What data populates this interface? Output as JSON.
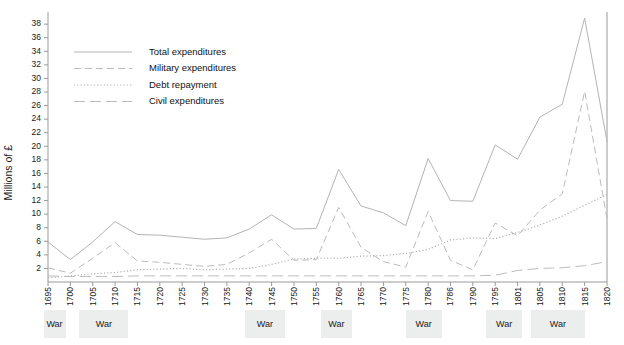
{
  "chart_data": {
    "type": "line",
    "title": "",
    "xlabel": "",
    "ylabel": "Millions of £",
    "ylim": [
      0,
      39
    ],
    "yticks": [
      2,
      4,
      6,
      8,
      10,
      12,
      14,
      16,
      18,
      20,
      22,
      24,
      26,
      28,
      30,
      32,
      34,
      36,
      38
    ],
    "grid": false,
    "legend_position": "top-left",
    "x": [
      1695,
      1700,
      1705,
      1710,
      1715,
      1720,
      1725,
      1730,
      1735,
      1740,
      1745,
      1750,
      1755,
      1760,
      1765,
      1770,
      1775,
      1780,
      1786,
      1790,
      1795,
      1801,
      1805,
      1810,
      1815,
      1820
    ],
    "xtick_labels": [
      "1695",
      "1700",
      "1705",
      "1710",
      "1715",
      "1720",
      "1725",
      "1730",
      "1735",
      "1740",
      "1745",
      "1750",
      "1755",
      "1760",
      "1765",
      "1770",
      "1775",
      "1780",
      "1786",
      "1790",
      "1795",
      "1801",
      "1805",
      "1810",
      "1815",
      "1820"
    ],
    "series": [
      {
        "name": "Total expenditures",
        "style": "solid",
        "values": [
          5.9,
          3.3,
          5.9,
          8.9,
          7.0,
          6.9,
          6.6,
          6.3,
          6.5,
          7.8,
          9.9,
          7.8,
          7.9,
          16.6,
          11.2,
          10.2,
          8.3,
          18.2,
          12.0,
          11.9,
          20.2,
          18.1,
          24.3,
          26.2,
          38.9,
          20.7
        ]
      },
      {
        "name": "Military expenditures",
        "style": "short-dash",
        "values": [
          2.1,
          1.3,
          3.5,
          5.8,
          3.1,
          2.9,
          2.6,
          2.3,
          2.6,
          4.3,
          6.3,
          3.2,
          3.3,
          11.0,
          5.1,
          3.0,
          2.2,
          10.4,
          3.2,
          1.8,
          8.7,
          6.8,
          10.6,
          13.0,
          28.1,
          9.3
        ]
      },
      {
        "name": "Debt repayment",
        "style": "dotted",
        "values": [
          0.6,
          0.9,
          1.2,
          1.4,
          1.8,
          1.9,
          2.0,
          1.8,
          1.9,
          2.0,
          2.6,
          3.4,
          3.5,
          3.5,
          3.8,
          3.9,
          4.2,
          4.8,
          6.2,
          6.5,
          6.4,
          7.3,
          8.4,
          9.7,
          11.3,
          12.9
        ]
      },
      {
        "name": "Civil expenditures",
        "style": "long-dash",
        "values": [
          0.9,
          0.8,
          0.8,
          0.8,
          0.9,
          0.9,
          0.9,
          0.9,
          0.9,
          0.9,
          0.9,
          0.9,
          0.9,
          0.9,
          0.9,
          0.9,
          0.9,
          0.9,
          0.9,
          0.9,
          1.0,
          1.7,
          2.0,
          2.1,
          2.4,
          3.0
        ]
      }
    ],
    "war_bands": [
      {
        "label": "War",
        "start": 1694,
        "end": 1698
      },
      {
        "label": "War",
        "start": 1702,
        "end": 1713
      },
      {
        "label": "War",
        "start": 1739,
        "end": 1748
      },
      {
        "label": "War",
        "start": 1756,
        "end": 1763
      },
      {
        "label": "War",
        "start": 1775,
        "end": 1783
      },
      {
        "label": "War",
        "start": 1793,
        "end": 1801
      },
      {
        "label": "War",
        "start": 1803,
        "end": 1815
      }
    ],
    "colors": {
      "total": "#b4b4b4",
      "military": "#bcbcbc",
      "debt": "#b0b0b0",
      "civil": "#bcbcbc",
      "axis": "#9a9a9a",
      "band": "#eceded",
      "text": "#1a1a1a"
    }
  },
  "legend": {
    "items": [
      {
        "label": "Total expenditures"
      },
      {
        "label": "Military expenditures"
      },
      {
        "label": "Debt repayment"
      },
      {
        "label": "Civil expenditures"
      }
    ]
  }
}
